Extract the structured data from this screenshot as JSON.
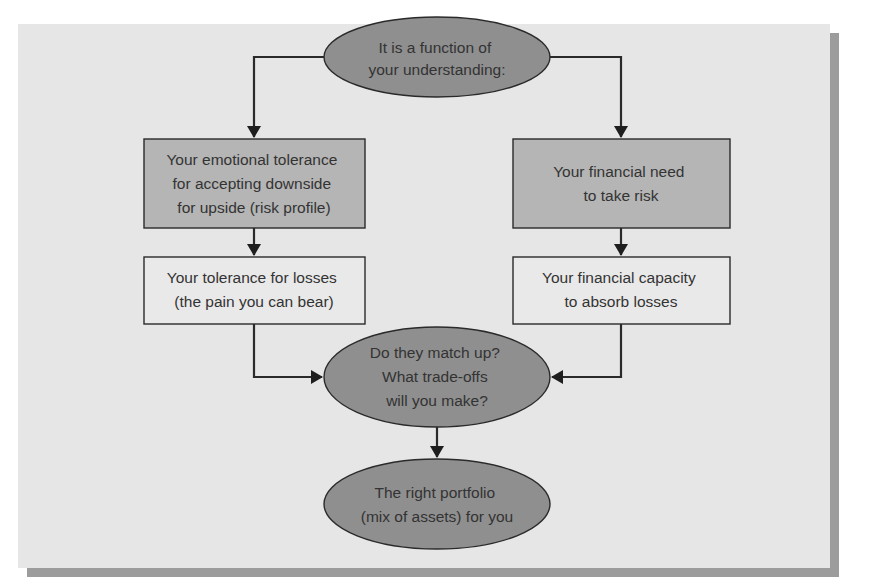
{
  "diagram": {
    "colors": {
      "panel_background": "#e6e6e6",
      "panel_shadow": "#9c9c9c",
      "ellipse_fill": "#8f8f8f",
      "shaded_box_fill": "#b5b5b5",
      "plain_box_fill": "#e9e9e9",
      "stroke": "#2a2a2a",
      "text": "#333333"
    },
    "nodes": {
      "top": {
        "shape": "ellipse",
        "lines": [
          "It is a function of",
          "your understanding:"
        ]
      },
      "emotional_tolerance": {
        "shape": "shaded-rectangle",
        "lines": [
          "Your emotional tolerance",
          "for accepting downside",
          "for upside (risk profile)"
        ]
      },
      "financial_need": {
        "shape": "shaded-rectangle",
        "lines": [
          "Your financial need",
          "to take risk"
        ]
      },
      "loss_tolerance": {
        "shape": "rectangle",
        "lines": [
          "Your tolerance for losses",
          "(the pain you can bear)"
        ]
      },
      "financial_capacity": {
        "shape": "rectangle",
        "lines": [
          "Your financial capacity",
          "to absorb losses"
        ]
      },
      "match_up": {
        "shape": "ellipse",
        "lines": [
          "Do they match up?",
          "What trade-offs",
          "will you make?"
        ]
      },
      "right_portfolio": {
        "shape": "ellipse",
        "lines": [
          "The right portfolio",
          "(mix of assets) for you"
        ]
      }
    },
    "edges": [
      {
        "from": "top",
        "to": "emotional_tolerance"
      },
      {
        "from": "top",
        "to": "financial_need"
      },
      {
        "from": "emotional_tolerance",
        "to": "loss_tolerance"
      },
      {
        "from": "financial_need",
        "to": "financial_capacity"
      },
      {
        "from": "loss_tolerance",
        "to": "match_up"
      },
      {
        "from": "financial_capacity",
        "to": "match_up"
      },
      {
        "from": "match_up",
        "to": "right_portfolio"
      }
    ]
  }
}
